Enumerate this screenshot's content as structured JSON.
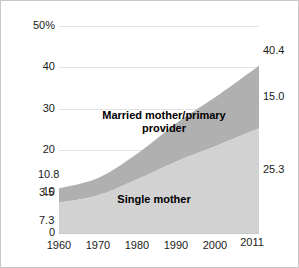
{
  "chart_data": {
    "type": "area",
    "stacked": true,
    "title": "",
    "subtitle": "",
    "xlabel": "",
    "ylabel": "",
    "x": [
      1960,
      1970,
      1980,
      1990,
      2000,
      2011
    ],
    "xtick_labels": [
      "1960",
      "1970",
      "1980",
      "1990",
      "2000",
      "2011"
    ],
    "xlim": [
      1960,
      2011
    ],
    "ylim": [
      0,
      50
    ],
    "ytick_labels": [
      "0",
      "10",
      "20",
      "30",
      "40",
      "50%"
    ],
    "ytick_values": [
      0,
      10,
      20,
      30,
      40,
      50
    ],
    "grid": "horizontal",
    "legend_position": "inside-bands",
    "series": [
      {
        "name": "Single mother",
        "color": "#d2d2d2",
        "values": [
          7.3,
          9.1,
          13.0,
          17.3,
          21.0,
          25.3
        ],
        "start_label": "7.3",
        "end_label": "25.3"
      },
      {
        "name": "Married mother/primary provider",
        "color": "#b0b0b0",
        "values": [
          3.5,
          4.2,
          6.2,
          9.3,
          11.9,
          15.0
        ],
        "start_label": "3.5",
        "end_label": "15.0"
      }
    ],
    "totals": {
      "values": [
        10.8,
        13.3,
        19.2,
        26.6,
        32.9,
        40.4
      ],
      "start_label": "10.8",
      "end_label": "40.4"
    },
    "annotations": {
      "band_label_top": "Married mother/primary\nprovider",
      "band_label_bottom": "Single mother",
      "left_total": "10.8",
      "left_married": "3.5",
      "left_single": "7.3",
      "right_total": "40.4",
      "right_married": "15.0",
      "right_single": "25.3"
    }
  },
  "colors": {
    "band_top": "#b0b0b0",
    "band_bottom": "#d2d2d2",
    "gridline": "#e3e3e3",
    "axis": "#c9c9c9",
    "text": "#1a1a1a",
    "frame": "#c8c8c8",
    "background": "#ffffff"
  }
}
